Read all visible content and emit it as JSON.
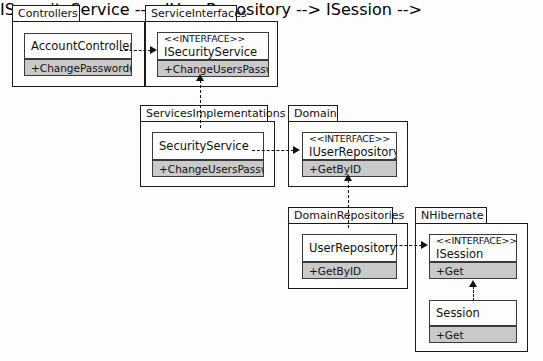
{
  "diagram": {
    "background_color": "#fdfdfd",
    "line_color": "#111111",
    "operation_fill_color": "#c9c9c9",
    "class_fill_color": "#fdfdfd"
  },
  "packages": [
    {
      "id": "controllers",
      "label": "Controllers",
      "classes": [
        {
          "id": "account-controller",
          "stereotype": "",
          "name": "AccountController",
          "operations": [
            "+ChangePassword()"
          ]
        }
      ]
    },
    {
      "id": "service-interfaces",
      "label": "ServiceInterfaces",
      "classes": [
        {
          "id": "isecurity-service",
          "stereotype": "<<INTERFACE>>",
          "name": "ISecurityService",
          "operations": [
            "+ChangeUsersPassword"
          ]
        }
      ]
    },
    {
      "id": "services-implementations",
      "label": "ServicesImplementations",
      "classes": [
        {
          "id": "security-service",
          "stereotype": "",
          "name": "SecurityService",
          "operations": [
            "+ChangeUsersPassword"
          ]
        }
      ]
    },
    {
      "id": "domain",
      "label": "Domain",
      "classes": [
        {
          "id": "iuser-repository",
          "stereotype": "<<INTERFACE>>",
          "name": "IUserRepository",
          "operations": [
            "+GetByID"
          ]
        }
      ]
    },
    {
      "id": "domain-repositories",
      "label": "DomainRepositories",
      "classes": [
        {
          "id": "user-repository",
          "stereotype": "",
          "name": "UserRepository",
          "operations": [
            "+GetByID"
          ]
        }
      ]
    },
    {
      "id": "nhibernate",
      "label": "NHibernate",
      "classes": [
        {
          "id": "isession",
          "stereotype": "<<INTERFACE>>",
          "name": "ISession",
          "operations": [
            "+Get"
          ]
        },
        {
          "id": "session",
          "stereotype": "",
          "name": "Session",
          "operations": [
            "+Get"
          ]
        }
      ]
    }
  ],
  "relationships": [
    {
      "id": "rel-1",
      "from": "AccountController",
      "to": "ISecurityService",
      "type": "dependency",
      "direction": "right"
    },
    {
      "id": "rel-2",
      "from": "SecurityService",
      "to": "ISecurityService",
      "type": "realization",
      "direction": "up"
    },
    {
      "id": "rel-3",
      "from": "SecurityService",
      "to": "IUserRepository",
      "type": "dependency",
      "direction": "right"
    },
    {
      "id": "rel-4",
      "from": "UserRepository",
      "to": "IUserRepository",
      "type": "realization",
      "direction": "up"
    },
    {
      "id": "rel-5",
      "from": "UserRepository",
      "to": "ISession",
      "type": "dependency",
      "direction": "right"
    },
    {
      "id": "rel-6",
      "from": "Session",
      "to": "ISession",
      "type": "realization",
      "direction": "up"
    }
  ]
}
